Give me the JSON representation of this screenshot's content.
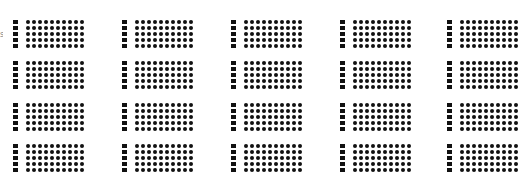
{
  "edge_glyph": "s",
  "grid": {
    "rows": 4,
    "columns": 5,
    "cell": {
      "bar_squares": 5,
      "matrix_rows": 5,
      "matrix_columns": 10
    }
  },
  "colors": {
    "ink": "#111111",
    "background": "#ffffff"
  }
}
